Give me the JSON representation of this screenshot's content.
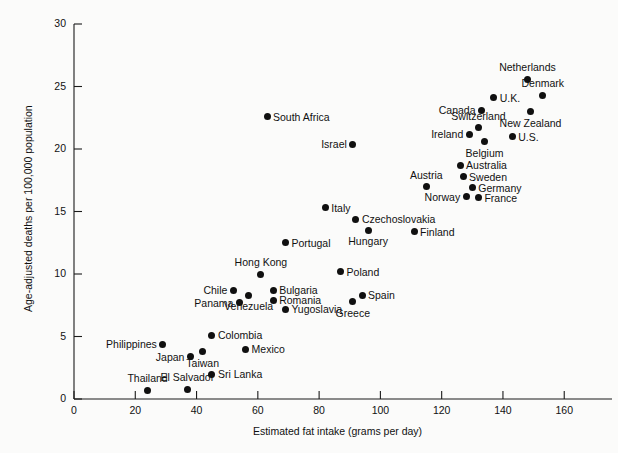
{
  "chart_data": {
    "type": "scatter",
    "title": "",
    "xlabel": "Estimated fat intake (grams per day)",
    "ylabel": "Age-adjusted deaths per 100,000 population",
    "xlim": [
      0,
      172
    ],
    "ylim": [
      0,
      30
    ],
    "xticks": [
      0,
      20,
      40,
      60,
      80,
      100,
      120,
      140,
      160
    ],
    "yticks": [
      0,
      5,
      10,
      15,
      20,
      25,
      30
    ],
    "grid": false,
    "legend": "none",
    "points": [
      {
        "label": "Netherlands",
        "x": 148,
        "y": 25.6,
        "label_pos": "above"
      },
      {
        "label": "U.K.",
        "x": 137,
        "y": 24.1,
        "label_pos": "right"
      },
      {
        "label": "Denmark",
        "x": 153,
        "y": 24.3,
        "label_pos": "above"
      },
      {
        "label": "Canada",
        "x": 133,
        "y": 23.1,
        "label_pos": "left"
      },
      {
        "label": "New Zealand",
        "x": 149,
        "y": 23.0,
        "label_pos": "below"
      },
      {
        "label": "Switzerland",
        "x": 132,
        "y": 21.7,
        "label_pos": "above"
      },
      {
        "label": "Ireland",
        "x": 129,
        "y": 21.2,
        "label_pos": "left"
      },
      {
        "label": "Belgium",
        "x": 134,
        "y": 20.6,
        "label_pos": "below"
      },
      {
        "label": "U.S.",
        "x": 143,
        "y": 21.0,
        "label_pos": "right"
      },
      {
        "label": "South Africa",
        "x": 63,
        "y": 22.6,
        "label_pos": "right"
      },
      {
        "label": "Israel",
        "x": 91,
        "y": 20.4,
        "label_pos": "left"
      },
      {
        "label": "Australia",
        "x": 126,
        "y": 18.7,
        "label_pos": "right"
      },
      {
        "label": "Sweden",
        "x": 127,
        "y": 17.8,
        "label_pos": "right"
      },
      {
        "label": "Germany",
        "x": 130,
        "y": 16.9,
        "label_pos": "right"
      },
      {
        "label": "Austria",
        "x": 115,
        "y": 17.0,
        "label_pos": "above"
      },
      {
        "label": "Norway",
        "x": 128,
        "y": 16.2,
        "label_pos": "left"
      },
      {
        "label": "France",
        "x": 132,
        "y": 16.1,
        "label_pos": "right"
      },
      {
        "label": "Italy",
        "x": 82,
        "y": 15.3,
        "label_pos": "right"
      },
      {
        "label": "Czechoslovakia",
        "x": 92,
        "y": 14.4,
        "label_pos": "right"
      },
      {
        "label": "Hungary",
        "x": 96,
        "y": 13.5,
        "label_pos": "below"
      },
      {
        "label": "Finland",
        "x": 111,
        "y": 13.4,
        "label_pos": "right"
      },
      {
        "label": "Portugal",
        "x": 69,
        "y": 12.5,
        "label_pos": "right"
      },
      {
        "label": "Hong Kong",
        "x": 61,
        "y": 10.0,
        "label_pos": "above"
      },
      {
        "label": "Poland",
        "x": 87,
        "y": 10.2,
        "label_pos": "right"
      },
      {
        "label": "Chile",
        "x": 52,
        "y": 8.7,
        "label_pos": "left"
      },
      {
        "label": "Bulgaria",
        "x": 65,
        "y": 8.7,
        "label_pos": "right"
      },
      {
        "label": "Venezuela",
        "x": 57,
        "y": 8.3,
        "label_pos": "below"
      },
      {
        "label": "Romania",
        "x": 65,
        "y": 7.9,
        "label_pos": "right"
      },
      {
        "label": "Panama",
        "x": 54,
        "y": 7.7,
        "label_pos": "left"
      },
      {
        "label": "Yugoslavia",
        "x": 69,
        "y": 7.2,
        "label_pos": "right"
      },
      {
        "label": "Spain",
        "x": 94,
        "y": 8.3,
        "label_pos": "right"
      },
      {
        "label": "Greece",
        "x": 91,
        "y": 7.8,
        "label_pos": "below"
      },
      {
        "label": "Colombia",
        "x": 45,
        "y": 5.1,
        "label_pos": "right"
      },
      {
        "label": "Philippines",
        "x": 29,
        "y": 4.4,
        "label_pos": "left"
      },
      {
        "label": "Mexico",
        "x": 56,
        "y": 4.0,
        "label_pos": "right"
      },
      {
        "label": "Taiwan",
        "x": 42,
        "y": 3.8,
        "label_pos": "below"
      },
      {
        "label": "Japan",
        "x": 38,
        "y": 3.4,
        "label_pos": "left"
      },
      {
        "label": "Sri Lanka",
        "x": 45,
        "y": 2.0,
        "label_pos": "right"
      },
      {
        "label": "Thailand",
        "x": 24,
        "y": 0.7,
        "label_pos": "above"
      },
      {
        "label": "El Salvador",
        "x": 37,
        "y": 0.8,
        "label_pos": "above"
      }
    ]
  },
  "colors": {
    "marker": "#101010",
    "axis": "#1a1a1a",
    "background": "#fbfbfa",
    "text": "#111111"
  }
}
